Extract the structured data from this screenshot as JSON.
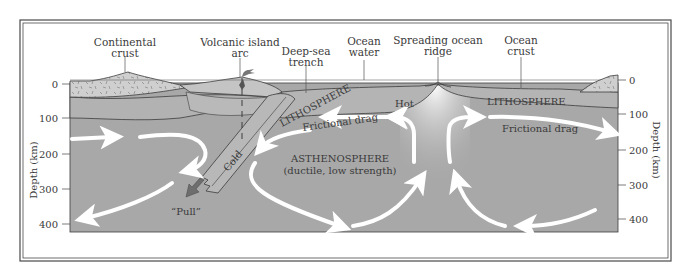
{
  "diagram": {
    "type": "plate-tectonics-cross-section",
    "top_labels": {
      "continental_crust": [
        "Continental",
        "crust"
      ],
      "volcanic_island_arc": [
        "Volcanic island",
        "arc"
      ],
      "deep_sea_trench": [
        "Deep-sea",
        "trench"
      ],
      "ocean_water": [
        "Ocean",
        "water"
      ],
      "spreading_ocean_ridge": [
        "Spreading ocean",
        "ridge"
      ],
      "ocean_crust": [
        "Ocean",
        "crust"
      ]
    },
    "inner_labels": {
      "lithosphere_left": "LITHOSPHERE",
      "lithosphere_right": "LITHOSPHERE",
      "hot": "Hot",
      "cold": "Cold",
      "frictional_drag_left": "Frictional drag",
      "frictional_drag_right": "Frictional drag",
      "asthenosphere": "ASTHENOSPHERE",
      "asthenosphere_sub": "(ductile, low strength)",
      "pull": "“Pull”"
    },
    "axis": {
      "title": "Depth (km)",
      "ticks": [
        "0",
        "100",
        "200",
        "300",
        "400"
      ]
    },
    "colors": {
      "mantle": "#a8a8a8",
      "lithosphere": "#b4b4b4",
      "crust": "#cfcfcf",
      "outline": "#3c3c3c",
      "arrow": "#ffffff",
      "pull_arrow": "#6e6e6e",
      "frame": "#4a4a4a"
    }
  }
}
